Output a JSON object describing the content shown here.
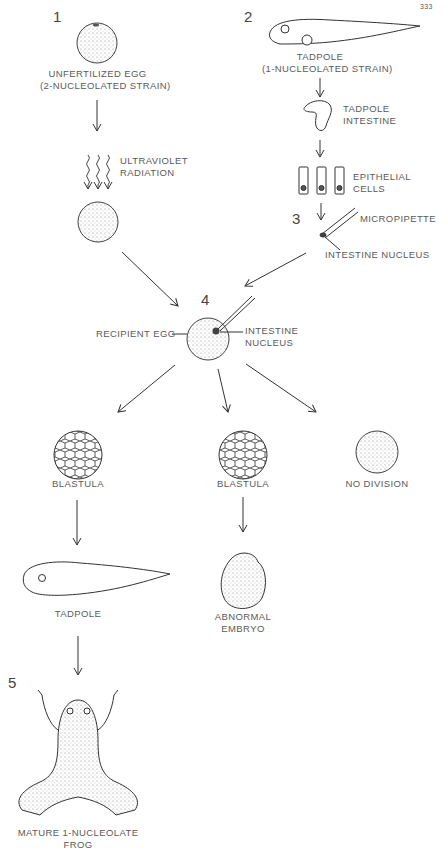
{
  "page_number": "333",
  "steps": [
    {
      "number": "1",
      "label_line1": "UNFERTILIZED EGG",
      "label_line2": "(2-NUCLEOLATED STRAIN)"
    },
    {
      "number": "2",
      "label_line1": "TADPOLE",
      "label_line2": "(1-NUCLEOLATED STRAIN)"
    },
    {
      "number": "3"
    },
    {
      "number": "4"
    },
    {
      "number": "5"
    }
  ],
  "labels": {
    "uv_line1": "ULTRAVIOLET",
    "uv_line2": "RADIATION",
    "tadpole_intestine_line1": "TADPOLE",
    "tadpole_intestine_line2": "INTESTINE",
    "epithelial_line1": "EPITHELIAL",
    "epithelial_line2": "CELLS",
    "micropipette": "MICROPIPETTE",
    "intestine_nucleus_pipette": "INTESTINE NUCLEUS",
    "recipient_egg": "RECIPIENT EGG",
    "intestine_nucleus_egg_line1": "INTESTINE",
    "intestine_nucleus_egg_line2": "NUCLEUS",
    "blastula_left": "BLASTULA",
    "blastula_middle": "BLASTULA",
    "no_division": "NO DIVISION",
    "tadpole_result": "TADPOLE",
    "abnormal_line1": "ABNORMAL",
    "abnormal_line2": "EMBRYO",
    "frog_line1": "MATURE 1-NUCLEOLATE",
    "frog_line2": "FROG"
  },
  "colors": {
    "ink": "#3a3a3a",
    "stipple": "#d8d8d8",
    "text": "#5a5a5a"
  }
}
